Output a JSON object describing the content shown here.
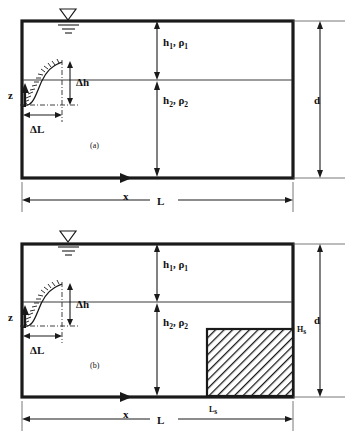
{
  "figure": {
    "panels": [
      {
        "id": "a",
        "caption": "(a)",
        "labels": {
          "layer1": "h₁, ρ1",
          "layer1_main": "h",
          "layer1_sub": "1",
          "layer1_rho": ", ρ",
          "layer1_rho_sub": "1",
          "layer2_main": "h",
          "layer2_sub": "2",
          "layer2_rho": ", ρ",
          "layer2_rho_sub": "2",
          "delta_h": "Δh",
          "delta_l": "ΔL",
          "depth": "d",
          "length": "L",
          "x_axis": "x",
          "z_axis": "z"
        }
      },
      {
        "id": "b",
        "caption": "(b)",
        "labels": {
          "layer1_main": "h",
          "layer1_sub": "1",
          "layer1_rho": ", ρ",
          "layer1_rho_sub": "1",
          "layer2_main": "h",
          "layer2_sub": "2",
          "layer2_rho": ", ρ",
          "layer2_rho_sub": "2",
          "delta_h": "Δh",
          "delta_l": "ΔL",
          "depth": "d",
          "length": "L",
          "x_axis": "x",
          "z_axis": "z",
          "block_height_main": "H",
          "block_height_sub": "s",
          "block_length_main": "L",
          "block_length_sub": "s"
        }
      }
    ],
    "colors": {
      "ink": "#1a1a1a",
      "thin_rule": "#3a3a3a",
      "background": "#ffffff",
      "hatch": "#1a1a1a"
    },
    "icons": {
      "water_surface": "free-surface-triangle-icon",
      "block_fill": "diagonal-hatch-pattern"
    }
  }
}
